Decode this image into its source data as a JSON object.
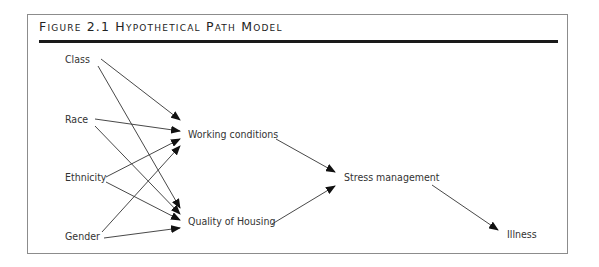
{
  "figure": {
    "title": "Figure 2.1 Hypothetical Path Model"
  },
  "nodes": {
    "class": "Class",
    "race": "Race",
    "ethnicity": "Ethnicity",
    "gender": "Gender",
    "working_conditions": "Working conditions",
    "quality_of_housing": "Quality of Housing",
    "stress_management": "Stress management",
    "illness": "Illness"
  },
  "edges": [
    {
      "from": "Class",
      "to": "Working conditions"
    },
    {
      "from": "Class",
      "to": "Quality of Housing"
    },
    {
      "from": "Race",
      "to": "Working conditions"
    },
    {
      "from": "Race",
      "to": "Quality of Housing"
    },
    {
      "from": "Ethnicity",
      "to": "Working conditions"
    },
    {
      "from": "Ethnicity",
      "to": "Quality of Housing"
    },
    {
      "from": "Gender",
      "to": "Working conditions"
    },
    {
      "from": "Gender",
      "to": "Quality of Housing"
    },
    {
      "from": "Working conditions",
      "to": "Stress management"
    },
    {
      "from": "Quality of Housing",
      "to": "Stress management"
    },
    {
      "from": "Stress management",
      "to": "Illness"
    }
  ]
}
